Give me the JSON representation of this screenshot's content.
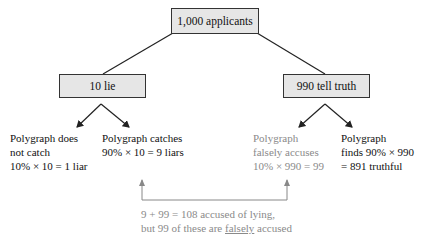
{
  "root": {
    "label": "1,000 applicants"
  },
  "branches": {
    "left": {
      "label": "10 lie",
      "outcomes": [
        {
          "lines": [
            "Polygraph does",
            "not catch",
            "10% × 10 = 1 liar"
          ],
          "style": "dark"
        },
        {
          "lines": [
            "Polygraph catches",
            "90% × 10 = 9 liars"
          ],
          "style": "dark"
        }
      ]
    },
    "right": {
      "label": "990 tell truth",
      "outcomes": [
        {
          "lines": [
            "Polygraph",
            "falsely accuses",
            "10% × 990 = 99"
          ],
          "style": "gray"
        },
        {
          "lines": [
            "Polygraph",
            "finds 90% × 990",
            "= 891 truthful"
          ],
          "style": "dark"
        }
      ]
    }
  },
  "summary": {
    "line1": "9 + 99 = 108 accused of lying,",
    "line2_prefix": "but 99 of these are ",
    "line2_underlined": "falsely",
    "line2_suffix": " accused"
  },
  "colors": {
    "box_fill": "#e6e6e6",
    "line": "#222222",
    "gray_text": "#8a8a8a"
  }
}
